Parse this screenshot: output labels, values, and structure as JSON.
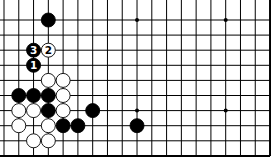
{
  "diagram": {
    "type": "go-board-fragment",
    "cols": 19,
    "rows": 10,
    "edges": {
      "bottom": true,
      "right": true,
      "top": false,
      "left": false
    },
    "colors": {
      "background": "#ffffff",
      "line": "#000000",
      "black": "#000000",
      "white": "#ffffff"
    },
    "star_points": [
      [
        9,
        0
      ],
      [
        15,
        0
      ],
      [
        9,
        6
      ],
      [
        15,
        6
      ]
    ],
    "stones": [
      {
        "col": 3,
        "row": 0,
        "color": "black",
        "label": ""
      },
      {
        "col": 2,
        "row": 2,
        "color": "black",
        "label": "3"
      },
      {
        "col": 3,
        "row": 2,
        "color": "white",
        "label": "2"
      },
      {
        "col": 2,
        "row": 3,
        "color": "black",
        "label": "1"
      },
      {
        "col": 3,
        "row": 4,
        "color": "white",
        "label": ""
      },
      {
        "col": 4,
        "row": 4,
        "color": "white",
        "label": ""
      },
      {
        "col": 1,
        "row": 5,
        "color": "black",
        "label": ""
      },
      {
        "col": 2,
        "row": 5,
        "color": "black",
        "label": ""
      },
      {
        "col": 3,
        "row": 5,
        "color": "black",
        "label": ""
      },
      {
        "col": 4,
        "row": 5,
        "color": "white",
        "label": ""
      },
      {
        "col": 1,
        "row": 6,
        "color": "white",
        "label": ""
      },
      {
        "col": 2,
        "row": 6,
        "color": "white",
        "label": ""
      },
      {
        "col": 3,
        "row": 6,
        "color": "black",
        "label": ""
      },
      {
        "col": 4,
        "row": 6,
        "color": "white",
        "label": ""
      },
      {
        "col": 6,
        "row": 6,
        "color": "black",
        "label": ""
      },
      {
        "col": 1,
        "row": 7,
        "color": "white",
        "label": ""
      },
      {
        "col": 3,
        "row": 7,
        "color": "white",
        "label": ""
      },
      {
        "col": 4,
        "row": 7,
        "color": "black",
        "label": ""
      },
      {
        "col": 5,
        "row": 7,
        "color": "black",
        "label": ""
      },
      {
        "col": 9,
        "row": 7,
        "color": "black",
        "label": ""
      },
      {
        "col": 2,
        "row": 8,
        "color": "white",
        "label": ""
      },
      {
        "col": 3,
        "row": 8,
        "color": "white",
        "label": ""
      }
    ]
  }
}
